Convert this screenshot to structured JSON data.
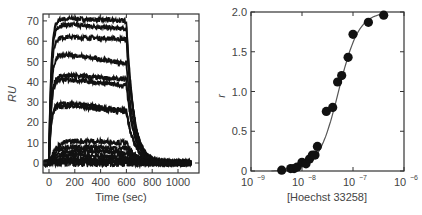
{
  "chart_data": [
    {
      "type": "line",
      "title": "",
      "xlabel": "Time (sec)",
      "ylabel": "RU",
      "xlim": [
        -40,
        1100
      ],
      "ylim": [
        -5,
        75
      ],
      "xticks": [
        0,
        200,
        400,
        600,
        800,
        1000
      ],
      "yticks": [
        0,
        10,
        20,
        30,
        40,
        50,
        60,
        70
      ],
      "grid": false,
      "legend": null,
      "injection_start_sec": 0,
      "injection_end_sec": 600,
      "series": [
        {
          "name": "sensorgram-1",
          "plateau": 71,
          "end_association": 70
        },
        {
          "name": "sensorgram-2",
          "plateau": 68,
          "end_association": 66
        },
        {
          "name": "sensorgram-3",
          "plateau": 62,
          "end_association": 61
        },
        {
          "name": "sensorgram-4",
          "plateau": 53,
          "end_association": 49
        },
        {
          "name": "sensorgram-5",
          "plateau": 43,
          "end_association": 41
        },
        {
          "name": "sensorgram-6",
          "plateau": 41,
          "end_association": 38
        },
        {
          "name": "sensorgram-7",
          "plateau": 29,
          "end_association": 26
        },
        {
          "name": "sensorgram-8",
          "plateau": 28,
          "end_association": 25
        },
        {
          "name": "sensorgram-9",
          "plateau": 11,
          "end_association": 10
        },
        {
          "name": "sensorgram-10",
          "plateau": 8,
          "end_association": 7
        },
        {
          "name": "sensorgram-11",
          "plateau": 6,
          "end_association": 5
        },
        {
          "name": "sensorgram-12",
          "plateau": 4,
          "end_association": 3
        },
        {
          "name": "sensorgram-13",
          "plateau": 2,
          "end_association": 2
        },
        {
          "name": "sensorgram-14",
          "plateau": 1,
          "end_association": 1
        }
      ]
    },
    {
      "type": "scatter",
      "title": "",
      "xlabel": "[Hoechst 33258]",
      "ylabel": "r",
      "xscale": "log",
      "xlim": [
        1e-09,
        1e-06
      ],
      "ylim": [
        0,
        2.0
      ],
      "xticks": [
        "10^-9",
        "10^-8",
        "10^-7",
        "10^-6"
      ],
      "yticks": [
        0,
        0.5,
        1.0,
        1.5,
        2.0
      ],
      "grid": false,
      "legend": null,
      "series": [
        {
          "name": "data",
          "x": [
            4e-09,
            6e-09,
            7e-09,
            8e-09,
            1e-08,
            1.2e-08,
            1.4e-08,
            1.6e-08,
            1.8e-08,
            2e-08,
            3e-08,
            4e-08,
            5e-08,
            6e-08,
            8e-08,
            1e-07,
            2e-07,
            4e-07
          ],
          "y": [
            0.01,
            0.03,
            0.03,
            0.05,
            0.11,
            0.09,
            0.15,
            0.2,
            0.2,
            0.31,
            0.75,
            0.8,
            1.12,
            1.2,
            1.43,
            1.72,
            1.87,
            1.96
          ]
        },
        {
          "name": "fit",
          "model": "cooperative binding curve",
          "x": [
            3e-09,
            5e-09,
            1e-08,
            2e-08,
            3e-08,
            5e-08,
            7e-08,
            1e-07,
            2e-07,
            4e-07
          ],
          "y": [
            0.0,
            0.02,
            0.08,
            0.3,
            0.6,
            1.05,
            1.4,
            1.65,
            1.88,
            1.96
          ]
        }
      ]
    }
  ],
  "left_chart": {
    "ylabel": "RU",
    "xlabel": "Time (sec)",
    "yticks": [
      "0",
      "10",
      "20",
      "30",
      "40",
      "50",
      "60",
      "70"
    ],
    "xticks": [
      "0",
      "200",
      "400",
      "600",
      "800",
      "1000"
    ]
  },
  "right_chart": {
    "ylabel": "r",
    "xlabel": "[Hoechst 33258]",
    "yticks": [
      "0",
      "0.5",
      "1.0",
      "1.5",
      "2.0"
    ],
    "xticks_base": [
      "10",
      "10",
      "10",
      "10"
    ],
    "xticks_exp": [
      "−9",
      "−8",
      "−7",
      "−6"
    ]
  },
  "colors": {
    "trace": "#111111",
    "fit": "#555555",
    "axis": "#333333",
    "point": "#111111"
  }
}
